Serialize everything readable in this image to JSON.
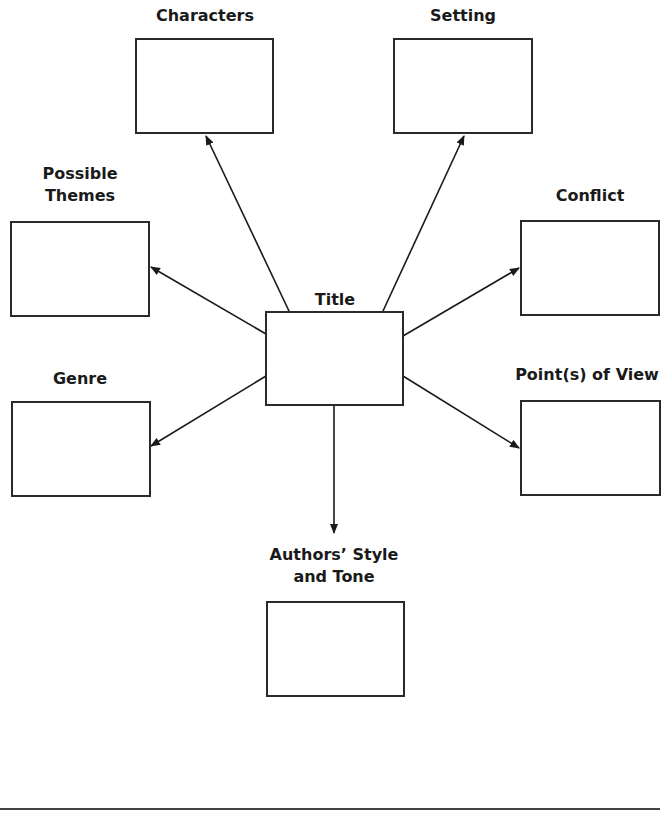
{
  "diagram": {
    "type": "story-map graphic organizer",
    "center": {
      "label": "Title"
    },
    "nodes": [
      {
        "id": "characters",
        "label": "Characters"
      },
      {
        "id": "setting",
        "label": "Setting"
      },
      {
        "id": "themes",
        "label_line1": "Possible",
        "label_line2": "Themes"
      },
      {
        "id": "conflict",
        "label": "Conflict"
      },
      {
        "id": "genre",
        "label": "Genre"
      },
      {
        "id": "pov",
        "label": "Point(s) of View"
      },
      {
        "id": "style",
        "label_line1": "Authors’ Style",
        "label_line2": "and Tone"
      }
    ],
    "edges": [
      {
        "from": "Title",
        "to": "Characters"
      },
      {
        "from": "Title",
        "to": "Setting"
      },
      {
        "from": "Title",
        "to": "Possible Themes"
      },
      {
        "from": "Title",
        "to": "Conflict"
      },
      {
        "from": "Title",
        "to": "Genre"
      },
      {
        "from": "Title",
        "to": "Point(s) of View"
      },
      {
        "from": "Title",
        "to": "Authors’ Style and Tone"
      }
    ]
  }
}
